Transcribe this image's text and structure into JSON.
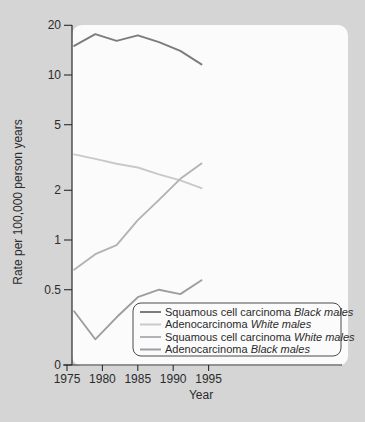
{
  "figure": {
    "background_color": "#d5d5d5",
    "panel_color": "#fbfbfb",
    "axis_color": "#2b2b2b"
  },
  "chart_data": {
    "type": "line",
    "title": "",
    "xlabel": "Year",
    "ylabel": "Rate per 100,000 person years",
    "y_scale": "log",
    "y_ticks": [
      20,
      10,
      5,
      2,
      1,
      0.5,
      0
    ],
    "y_tick_labels": [
      "20",
      "10",
      "5",
      "2",
      "1",
      "0.5",
      "0"
    ],
    "x_ticks": [
      1975,
      1980,
      1985,
      1990,
      1995
    ],
    "x_range": [
      1975,
      1995
    ],
    "grid": "off",
    "legend_position": "bottom-right",
    "x": [
      1976,
      1979,
      1982,
      1985,
      1988,
      1991,
      1994
    ],
    "series": [
      {
        "name": "Squamous cell carcinoma",
        "group": "Black males",
        "color": "#797d80",
        "values": [
          15,
          17.7,
          16.1,
          17.4,
          15.8,
          14,
          11.6
        ]
      },
      {
        "name": "Adenocarcinoma",
        "group": "White males",
        "color": "#c7c9ca",
        "values": [
          3.3,
          3.1,
          2.9,
          2.75,
          2.5,
          2.3,
          2.06
        ]
      },
      {
        "name": "Squamous cell carcinoma",
        "group": "White males",
        "color": "#b1b3b5",
        "values": [
          0.66,
          0.82,
          0.93,
          1.32,
          1.75,
          2.35,
          2.91
        ]
      },
      {
        "name": "Adenocarcinoma",
        "group": "Black males",
        "color": "#9c9ea1",
        "values": [
          0.37,
          0.25,
          0.34,
          0.45,
          0.5,
          0.47,
          0.57
        ]
      }
    ]
  }
}
